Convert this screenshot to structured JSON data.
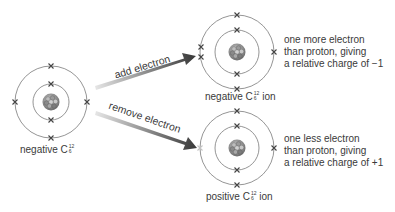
{
  "atoms": [
    {
      "id": "neutral",
      "label_prefix": "negative C",
      "mass_number": "12",
      "atomic_number": "6",
      "label_suffix": ""
    },
    {
      "id": "anion",
      "label_prefix": "negative C",
      "mass_number": "12",
      "atomic_number": "6",
      "label_suffix": " ion"
    },
    {
      "id": "cation",
      "label_prefix": "positive C",
      "mass_number": "12",
      "atomic_number": "6",
      "label_suffix": " ion"
    }
  ],
  "arrows": [
    {
      "id": "add",
      "label": "add electron"
    },
    {
      "id": "remove",
      "label": "remove electron"
    }
  ],
  "captions": {
    "anion": [
      "one more electron",
      "than proton, giving",
      "a relative charge of −1"
    ],
    "cation": [
      "one less electron",
      "than proton, giving",
      "a relative charge of +1"
    ]
  },
  "colors": {
    "orbit": "#7a7a7a",
    "electron": "#444444",
    "removed_electron": "#bbbbbb",
    "arrow_dark": "#444444",
    "arrow_light": "#e0e0e0"
  }
}
